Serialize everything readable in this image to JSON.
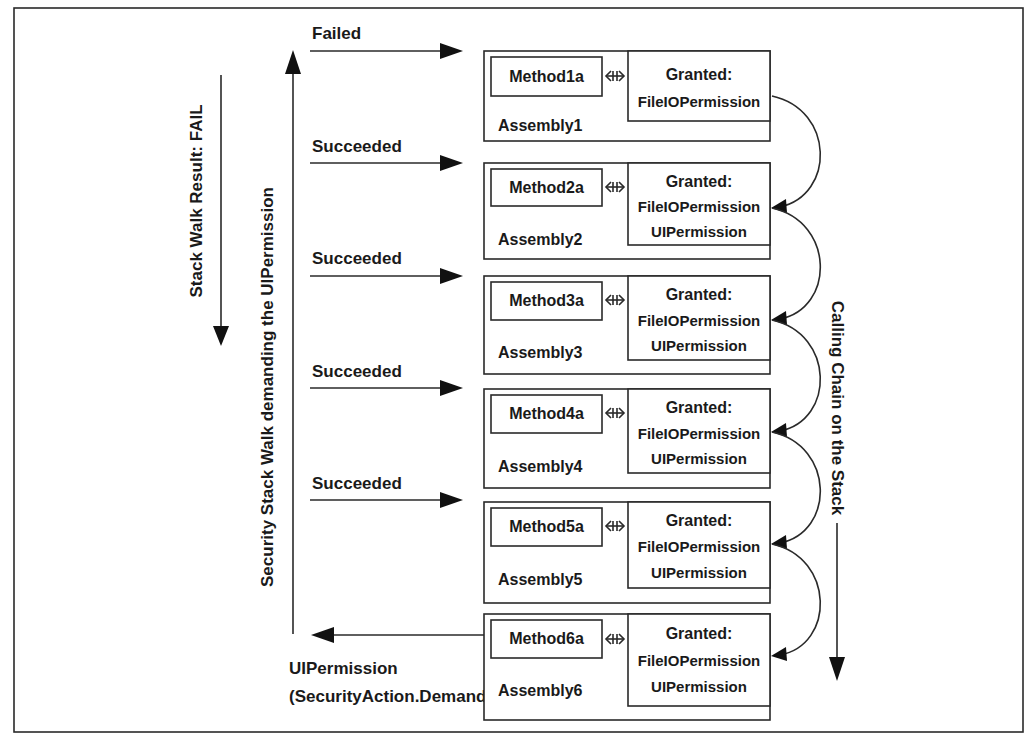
{
  "diagram": {
    "left_labels": {
      "stack_walk_result": "Stack Walk Result: FAIL",
      "security_stack_walk": "Security Stack Walk demanding the UIPermission"
    },
    "right_label": "Calling Chain on the Stack",
    "demand_label": {
      "line1": "UIPermission",
      "line2": "(SecurityAction.Demand)"
    },
    "check_results": [
      "Failed",
      "Succeeded",
      "Succeeded",
      "Succeeded",
      "Succeeded"
    ],
    "connector_icon": "double-arrow-icon",
    "granted_heading": "Granted:",
    "assemblies": [
      {
        "name": "Assembly1",
        "method": "Method1a",
        "permissions": [
          "FileIOPermission"
        ]
      },
      {
        "name": "Assembly2",
        "method": "Method2a",
        "permissions": [
          "FileIOPermission",
          "UIPermission"
        ]
      },
      {
        "name": "Assembly3",
        "method": "Method3a",
        "permissions": [
          "FileIOPermission",
          "UIPermission"
        ]
      },
      {
        "name": "Assembly4",
        "method": "Method4a",
        "permissions": [
          "FileIOPermission",
          "UIPermission"
        ]
      },
      {
        "name": "Assembly5",
        "method": "Method5a",
        "permissions": [
          "FileIOPermission",
          "UIPermission"
        ]
      },
      {
        "name": "Assembly6",
        "method": "Method6a",
        "permissions": [
          "FileIOPermission",
          "UIPermission"
        ]
      }
    ],
    "colors": {
      "line": "#2a2a2a",
      "text": "#1a1a1a",
      "background": "#ffffff"
    }
  }
}
